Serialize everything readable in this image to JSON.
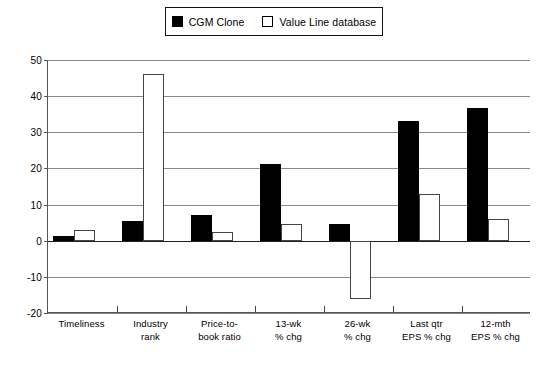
{
  "chart_data": {
    "type": "bar",
    "title": "",
    "xlabel": "",
    "ylabel": "",
    "ylim": [
      -20,
      50
    ],
    "yticks": [
      50,
      40,
      30,
      20,
      10,
      0,
      -10,
      -20
    ],
    "grid": true,
    "legend_position": "top-center",
    "categories": [
      "Timeliness",
      "Industry rank",
      "Price-to-book ratio",
      "13-wk % chg",
      "26-wk % chg",
      "Last qtr EPS % chg",
      "12-mth EPS % chg"
    ],
    "category_lines": [
      [
        "Timeliness"
      ],
      [
        "Industry",
        "rank"
      ],
      [
        "Price-to-",
        "book ratio"
      ],
      [
        "13-wk",
        "% chg"
      ],
      [
        "26-wk",
        "% chg"
      ],
      [
        "Last qtr",
        "EPS % chg"
      ],
      [
        "12-mth",
        "EPS % chg"
      ]
    ],
    "series": [
      {
        "name": "CGM Clone",
        "color": "#000000",
        "style": "filled",
        "values": [
          1.3,
          5.5,
          7,
          21.3,
          4.5,
          33.2,
          36.6
        ]
      },
      {
        "name": "Value Line database",
        "color": "#ffffff",
        "style": "outlined",
        "values": [
          3,
          46,
          2.5,
          4.5,
          -16,
          13,
          6
        ]
      }
    ]
  },
  "legend": {
    "items": [
      {
        "label": "CGM Clone",
        "swatch": "filled-square-icon"
      },
      {
        "label": "Value Line database",
        "swatch": "open-square-icon"
      }
    ]
  },
  "axis": {
    "y_tick_labels": [
      "50",
      "40",
      "30",
      "20",
      "10",
      "0",
      "-10",
      "-20"
    ]
  }
}
